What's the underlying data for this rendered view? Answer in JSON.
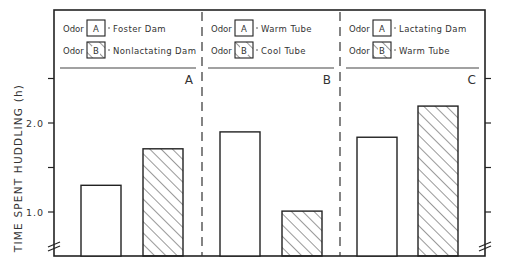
{
  "chart_data": {
    "type": "bar",
    "title": "",
    "xlabel": "",
    "ylabel": "TIME SPENT HUDDLING (h)",
    "ylim": [
      0.5,
      2.5
    ],
    "yticks": [
      1.0,
      1.5,
      2.0,
      2.5
    ],
    "ytick_labels": [
      "1.0",
      "",
      "2.0",
      ""
    ],
    "axis_break": true,
    "grid": false,
    "panels": [
      {
        "label": "A",
        "legend": [
          {
            "key": "A",
            "prefix": "Odor",
            "pattern": "open",
            "description": "Foster Dam"
          },
          {
            "key": "B",
            "prefix": "Odor",
            "pattern": "hatched",
            "description": "Nonlactating Dam"
          }
        ],
        "categories": [
          "Foster Dam",
          "Nonlactating Dam"
        ],
        "values": [
          1.3,
          1.71
        ]
      },
      {
        "label": "B",
        "legend": [
          {
            "key": "A",
            "prefix": "Odor",
            "pattern": "open",
            "description": "Warm Tube"
          },
          {
            "key": "B",
            "prefix": "Odor",
            "pattern": "hatched",
            "description": "Cool Tube"
          }
        ],
        "categories": [
          "Warm Tube",
          "Cool Tube"
        ],
        "values": [
          1.9,
          1.01
        ]
      },
      {
        "label": "C",
        "legend": [
          {
            "key": "A",
            "prefix": "Odor",
            "pattern": "open",
            "description": "Lactating Dam"
          },
          {
            "key": "B",
            "prefix": "Odor",
            "pattern": "hatched",
            "description": "Warm Tube"
          }
        ],
        "categories": [
          "Lactating Dam",
          "Warm Tube"
        ],
        "values": [
          1.84,
          2.19
        ]
      }
    ]
  }
}
